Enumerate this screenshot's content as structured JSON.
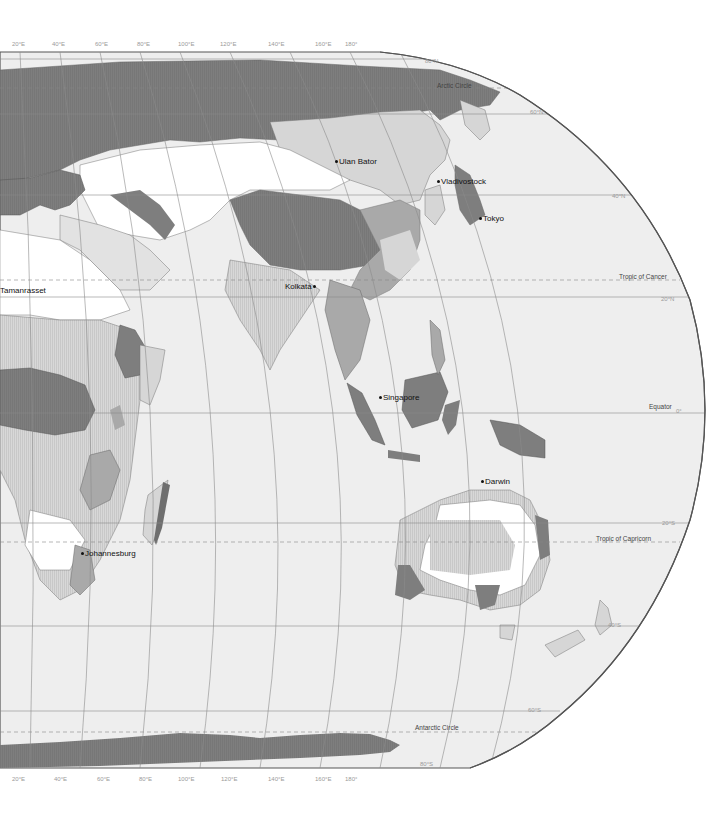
{
  "map": {
    "title": "",
    "projection": "Eastern hemisphere, curved meridians",
    "colors": {
      "ocean": "#eeeeee",
      "land_light": "#dadada",
      "land_hatched": "#cfcfcf",
      "land_white": "#ffffff",
      "land_medium": "#a9a9a9",
      "land_dark": "#7d7d7d",
      "outline": "#666666",
      "graticule": "#8c8c8c"
    },
    "longitude_labels_top": [
      "20°E",
      "40°E",
      "60°E",
      "80°E",
      "100°E",
      "120°E",
      "140°E",
      "160°E",
      "180°"
    ],
    "longitude_labels_bottom": [
      "20°E",
      "40°E",
      "60°E",
      "80°E",
      "100°E",
      "120°E",
      "140°E",
      "160°E",
      "180°"
    ],
    "latitude_labels": [
      "80°N",
      "60°N",
      "40°N",
      "20°N",
      "0°",
      "20°S",
      "40°S",
      "60°S",
      "80°S"
    ],
    "special_lines": {
      "arctic_circle": "Arctic Circle",
      "tropic_of_cancer": "Tropic of Cancer",
      "equator": "Equator",
      "tropic_of_capricorn": "Tropic of Capricorn",
      "antarctic_circle": "Antarctic Circle"
    },
    "cities": [
      {
        "name": "Ulan Bator"
      },
      {
        "name": "Vladivostock"
      },
      {
        "name": "Tokyo"
      },
      {
        "name": "Tamanrasset"
      },
      {
        "name": "Kolkata"
      },
      {
        "name": "Singapore"
      },
      {
        "name": "Darwin"
      },
      {
        "name": "Johannesburg"
      }
    ]
  }
}
